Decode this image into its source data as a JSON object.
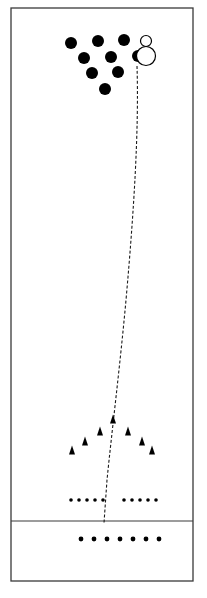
{
  "figure": {
    "canvas": {
      "width": 207,
      "height": 598
    },
    "background_color": "#ffffff",
    "stroke_color": "#1a1a1a",
    "fill_color": "#000000"
  },
  "frame": {
    "label": "outer-field-border",
    "x": 11,
    "y": 8,
    "width": 182,
    "height": 573,
    "stroke_width": 1.3,
    "color": "#3a3a3a"
  },
  "divider": {
    "label": "horizontal-divider-line",
    "x1": 11,
    "y1": 521,
    "x2": 193,
    "y2": 521,
    "stroke_width": 1.2,
    "color": "#3a3a3a"
  },
  "trajectory": {
    "label": "dashed-trajectory-path",
    "style": "dashed",
    "dash_pattern": "3 2",
    "stroke_width": 1.1,
    "color": "#1a1a1a",
    "path": "M 137 66 C 139 130 134 210 126 300 C 120 366 112 430 107 480 L 104 523",
    "start_point": [
      137,
      66
    ],
    "end_point": [
      104,
      523
    ]
  },
  "filled_circles": {
    "label": "filled-circle-cluster",
    "radius": 6,
    "color": "#000000",
    "points": [
      [
        71,
        43
      ],
      [
        98,
        41
      ],
      [
        124,
        40
      ],
      [
        138,
        56
      ],
      [
        84,
        58
      ],
      [
        111,
        57
      ],
      [
        92,
        73
      ],
      [
        118,
        72
      ],
      [
        105,
        89
      ]
    ]
  },
  "open_circles": {
    "label": "open-circle-markers",
    "color": "#000000",
    "stroke_width": 1.2,
    "markers": [
      {
        "name": "small-open-circle",
        "cx": 146,
        "cy": 41,
        "r": 5.5
      },
      {
        "name": "large-open-circle",
        "cx": 146,
        "cy": 56,
        "r": 9.5
      }
    ]
  },
  "triangles": {
    "label": "triangle-marker-formation",
    "color": "#000000",
    "width": 6,
    "height": 9,
    "points": [
      [
        113,
        419
      ],
      [
        100,
        431
      ],
      [
        128,
        431
      ],
      [
        85,
        441
      ],
      [
        142,
        441
      ],
      [
        72,
        450
      ],
      [
        152,
        450
      ]
    ]
  },
  "dot_row_upper": {
    "label": "upper-small-dot-rows",
    "radius": 1.8,
    "color": "#000000",
    "y": 500,
    "left_group_x": [
      71,
      79,
      87,
      95,
      103
    ],
    "right_group_x": [
      124,
      132,
      140,
      148,
      156
    ]
  },
  "dot_row_lower": {
    "label": "lower-small-dot-row",
    "radius": 2.4,
    "color": "#000000",
    "y": 539,
    "x_positions": [
      81,
      94,
      107,
      120,
      133,
      146,
      159
    ]
  }
}
